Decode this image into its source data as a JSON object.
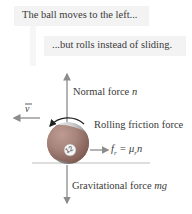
{
  "captions": {
    "line1": "The ball moves to the left...",
    "line2": "...but rolls instead of sliding."
  },
  "labels": {
    "normal_force": "Normal force ",
    "normal_symbol": "n",
    "velocity_symbol": "v",
    "friction_force": "Rolling friction force",
    "friction_eq_lhs": "f",
    "friction_eq_sub": "r",
    "friction_eq_mid": " = μ",
    "friction_eq_sub2": "r",
    "friction_eq_rhs": "n",
    "gravity_force": "Gravitational force ",
    "gravity_symbol": "mg",
    "ball_number": "12"
  },
  "colors": {
    "ball_stripe": "#8a4a3a",
    "ball_white": "#e8e8e8",
    "arrow": "#8c8c8c",
    "ground": "#bdbdbd",
    "caption_bg": "#f3f3f3"
  }
}
